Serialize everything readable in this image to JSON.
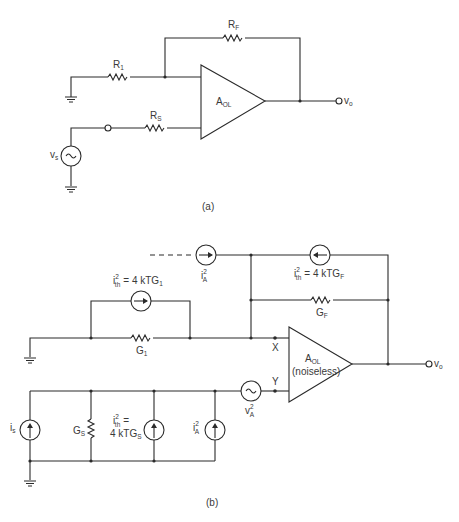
{
  "figure_a": {
    "caption": "(a)",
    "labels": {
      "r1": "R",
      "r1_sub": "1",
      "rf": "R",
      "rf_sub": "F",
      "rs": "R",
      "rs_sub": "S",
      "amp": "A",
      "amp_sub": "OL",
      "vs": "v",
      "vs_sub": "s",
      "vo": "v",
      "vo_sub": "o"
    }
  },
  "figure_b": {
    "caption": "(b)",
    "labels": {
      "ia_top": "i",
      "ia_top_sup": "2",
      "ia_top_sub": "A",
      "ith_f": "i",
      "ith_f_sup": "2",
      "ith_f_sub": "th",
      "ith_f_eq": "= 4 kTG",
      "ith_f_eq_sub": "F",
      "gf": "G",
      "gf_sub": "F",
      "ith_1": "i",
      "ith_1_sup": "2",
      "ith_1_sub": "th",
      "ith_1_eq": "= 4 kTG",
      "ith_1_eq_sub": "1",
      "g1": "G",
      "g1_sub": "1",
      "x": "X",
      "y": "Y",
      "amp": "A",
      "amp_sub": "OL",
      "amp_note": "(noiseless)",
      "vo": "v",
      "vo_sub": "o",
      "va": "v",
      "va_sup": "2",
      "va_sub": "A",
      "is": "i",
      "is_sub": "s",
      "gs": "G",
      "gs_sub": "S",
      "ith_s": "i",
      "ith_s_sup": "2",
      "ith_s_sub": "th",
      "ith_s_eq1": "=",
      "ith_s_eq2": "4 kTG",
      "ith_s_eq2_sub": "S",
      "ia_bot": "i",
      "ia_bot_sup": "2",
      "ia_bot_sub": "A"
    }
  }
}
